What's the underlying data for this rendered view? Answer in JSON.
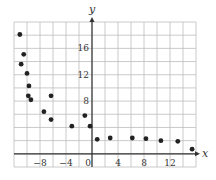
{
  "chart_data": {
    "type": "scatter",
    "title": "",
    "xlabel": "x",
    "ylabel": "y",
    "xlim": [
      -12,
      16
    ],
    "ylim": [
      -2,
      20
    ],
    "grid": true,
    "grid_step": 2,
    "legend": null,
    "x_ticks": [
      -8,
      -4,
      0,
      4,
      8,
      12
    ],
    "y_ticks": [
      8,
      12,
      16
    ],
    "series": [
      {
        "name": "data",
        "color": "#222222",
        "points": [
          {
            "x": -11.1,
            "y": 18.1
          },
          {
            "x": -10.5,
            "y": 15.1
          },
          {
            "x": -10.9,
            "y": 13.6
          },
          {
            "x": -10.0,
            "y": 12.2
          },
          {
            "x": -9.7,
            "y": 10.3
          },
          {
            "x": -9.8,
            "y": 8.8
          },
          {
            "x": -9.4,
            "y": 8.2
          },
          {
            "x": -6.3,
            "y": 8.8
          },
          {
            "x": -7.4,
            "y": 6.4
          },
          {
            "x": -6.3,
            "y": 5.2
          },
          {
            "x": -3.1,
            "y": 4.2
          },
          {
            "x": -1.1,
            "y": 5.8
          },
          {
            "x": -0.3,
            "y": 4.2
          },
          {
            "x": 0.8,
            "y": 2.2
          },
          {
            "x": 2.8,
            "y": 2.4
          },
          {
            "x": 6.2,
            "y": 2.4
          },
          {
            "x": 8.3,
            "y": 2.3
          },
          {
            "x": 10.6,
            "y": 2.0
          },
          {
            "x": 13.2,
            "y": 1.9
          },
          {
            "x": 15.4,
            "y": 0.7
          }
        ]
      }
    ]
  },
  "colors": {
    "grid": "#bdbdbd",
    "axis": "#333333",
    "point": "#222222",
    "background": "#ffffff"
  }
}
